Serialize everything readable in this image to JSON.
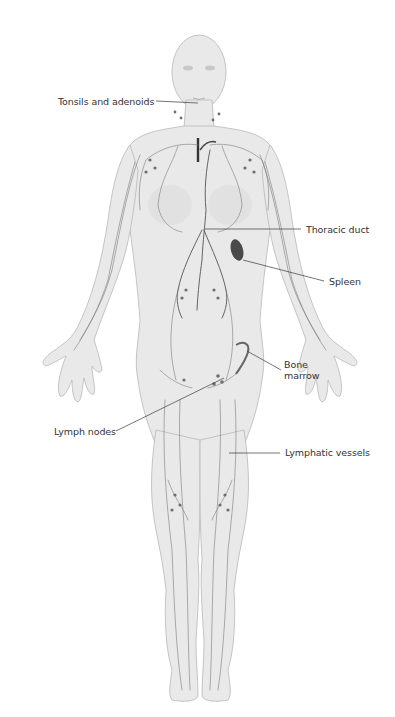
{
  "figure": {
    "background_color": "#ffffff",
    "body_color": "#e9e9e9",
    "vessel_color": "#7a7a7a",
    "organ_color": "#555555"
  },
  "labels": [
    {
      "id": "tonsils-and-adenoids",
      "text": "Tonsils and adenoids",
      "x": 58,
      "y": 96,
      "line": [
        156,
        101,
        198,
        103
      ]
    },
    {
      "id": "thoracic-duct",
      "text": "Thoracic duct",
      "x": 306,
      "y": 224,
      "line": [
        205,
        229,
        301,
        229
      ]
    },
    {
      "id": "spleen",
      "text": "Spleen",
      "x": 329,
      "y": 276,
      "line": [
        243,
        260,
        324,
        281
      ]
    },
    {
      "id": "bone-marrow",
      "text": "Bone\nmarrow",
      "x": 284,
      "y": 364,
      "line": [
        247,
        351,
        281,
        370
      ]
    },
    {
      "id": "lymph-nodes",
      "text": "Lymph nodes",
      "x": 54,
      "y": 426,
      "line": [
        116,
        431,
        224,
        378
      ]
    },
    {
      "id": "lymphatic-vessels",
      "text": "Lymphatic vessels",
      "x": 285,
      "y": 447,
      "line": [
        229,
        453,
        280,
        453
      ]
    }
  ]
}
